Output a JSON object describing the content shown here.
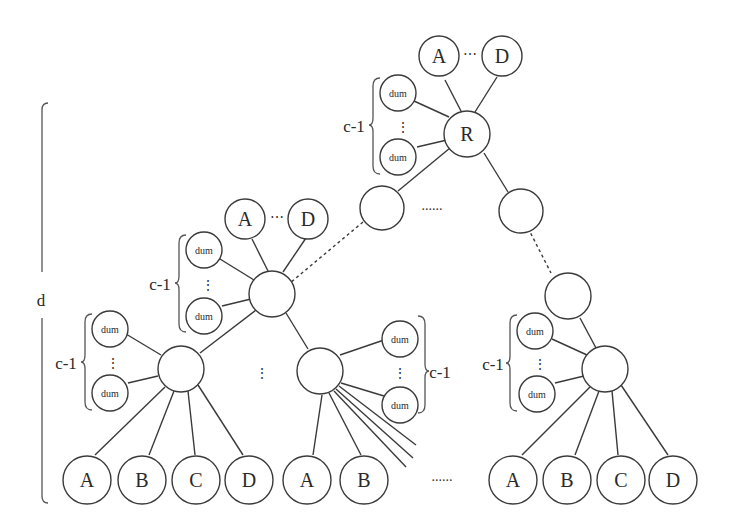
{
  "diagram": {
    "type": "tree",
    "height_label": "d",
    "dummy_count_label": "c-1",
    "dummy_label": "dum",
    "root": {
      "label": "R",
      "attached": [
        "A",
        "D"
      ],
      "ellipsis": "⋯"
    },
    "level2_left": {
      "label": "",
      "attached": [
        "A",
        "D"
      ],
      "ellipsis": "⋯"
    },
    "between_level1_dots": "......",
    "bottom_between_dots": "......",
    "vertical_dots": "⋮",
    "leaf_groups": [
      {
        "leaves": [
          "A",
          "B",
          "C",
          "D"
        ]
      },
      {
        "leaves": [
          "A",
          "B"
        ]
      },
      {
        "leaves": [
          "A",
          "B",
          "C",
          "D"
        ]
      }
    ]
  }
}
